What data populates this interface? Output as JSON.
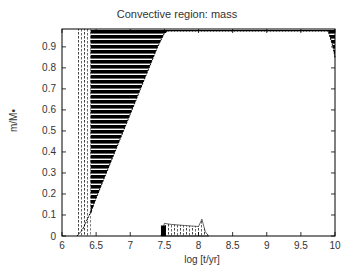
{
  "chart_data": {
    "type": "area",
    "title": "Convective region: mass",
    "xlabel": "log [t/yr]",
    "ylabel": "m/M•",
    "xlim": [
      6,
      10
    ],
    "ylim": [
      0,
      0.985
    ],
    "xticks": [
      "6",
      "6.5",
      "7",
      "7.5",
      "8",
      "8.5",
      "9",
      "9.5",
      "10"
    ],
    "yticks": [
      "0",
      "0.1",
      "0.2",
      "0.3",
      "0.4",
      "0.5",
      "0.6",
      "0.7",
      "0.8",
      "0.9"
    ],
    "grid": false,
    "legend": null,
    "series": [
      {
        "name": "Outer convective envelope (lower boundary)",
        "x": [
          6.22,
          6.3,
          6.4,
          6.5,
          6.6,
          6.8,
          7.0,
          7.2,
          7.4,
          7.5,
          7.55,
          8.0,
          9.0,
          9.9,
          9.97,
          10.0
        ],
        "y": [
          0.0,
          0.03,
          0.1,
          0.18,
          0.26,
          0.42,
          0.58,
          0.74,
          0.9,
          0.965,
          0.975,
          0.975,
          0.975,
          0.975,
          0.9,
          0.85
        ],
        "upper": 0.985
      },
      {
        "name": "Small core convective region",
        "x": [
          7.45,
          7.5,
          7.6,
          7.8,
          8.0,
          8.05,
          8.1,
          8.15
        ],
        "y": [
          0.0,
          0.06,
          0.055,
          0.05,
          0.045,
          0.08,
          0.02,
          0.0
        ]
      }
    ]
  }
}
